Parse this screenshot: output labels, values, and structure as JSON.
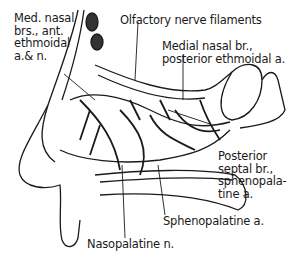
{
  "diagram": {
    "labels": [
      {
        "id": "med-nasal-brs",
        "text": "Med. nasal\nbrs., ant.\nethmoidal\na.& n."
      },
      {
        "id": "olfactory",
        "text": "Olfactory nerve filaments"
      },
      {
        "id": "medial-nasal-br",
        "text": "Medial nasal br.,\nposterior ethmoidal a."
      },
      {
        "id": "posterior-septal",
        "text": "Posterior\nseptal br.,\nsphenopala-\ntine a."
      },
      {
        "id": "sphenopalatine",
        "text": "Sphenopalatine a."
      },
      {
        "id": "nasopalatine",
        "text": "Nasopalatine n."
      }
    ],
    "colors": {
      "ink": "#1a1a1a",
      "background": "#ffffff"
    }
  }
}
